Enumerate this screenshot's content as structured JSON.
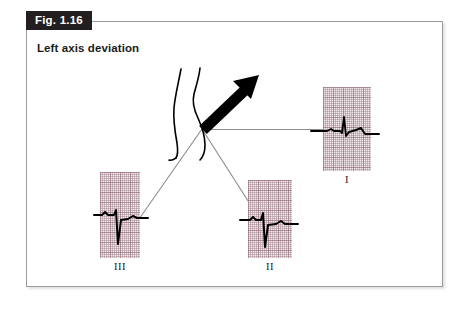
{
  "figure": {
    "tag_label": "Fig. 1.16",
    "title": "Left axis deviation"
  },
  "colors": {
    "tag_background": "#231f20",
    "tag_text": "#ffffff",
    "panel_border": "#9b9b9b",
    "page_background": "#ffffff",
    "ecg_paper": "#f2e9ec",
    "ecg_grid": "#966e78",
    "trace": "#000000",
    "axis_line": "#8c8c8c",
    "body_outline": "#000000",
    "arrow": "#000000"
  },
  "diagram": {
    "type": "ecg-axis-deviation",
    "vector": {
      "name": "mean-qrs-axis-arrow",
      "direction": "up-right",
      "origin_x": 202,
      "origin_y": 129,
      "tip_x": 259,
      "tip_y": 75
    },
    "axis_lines": [
      {
        "name": "lead-I-axis",
        "to": "I"
      },
      {
        "name": "lead-II-axis",
        "to": "II"
      },
      {
        "name": "lead-III-axis",
        "to": "III"
      }
    ]
  },
  "ecg_strips": [
    {
      "lead": "I",
      "label": "I",
      "polarity": "positive",
      "morphology": "small upright R wave with small s wave"
    },
    {
      "lead": "II",
      "label": "II",
      "polarity": "negative",
      "morphology": "small r wave with deep S wave"
    },
    {
      "lead": "III",
      "label": "III",
      "polarity": "negative",
      "morphology": "small r wave with deep S wave"
    }
  ]
}
